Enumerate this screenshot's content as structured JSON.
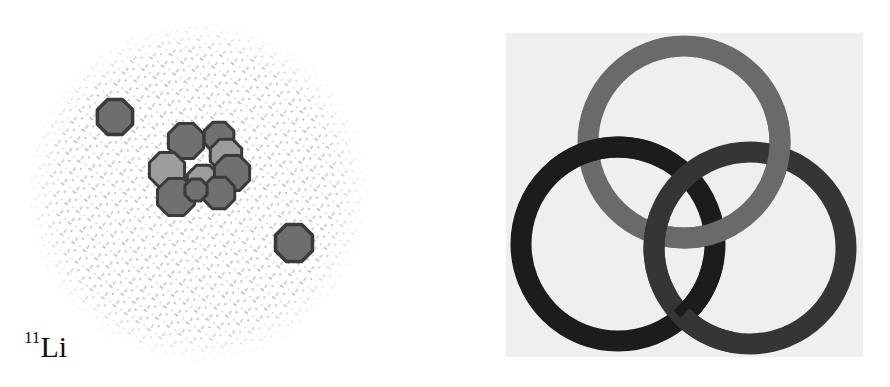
{
  "left_panel": {
    "title": "Lithium-11 halo nucleus",
    "label": {
      "superscript": "11",
      "element": "Li"
    },
    "halo_cloud": {
      "cx": 197,
      "cy": 192,
      "r": 172,
      "color": "#b8b8b8"
    },
    "core": {
      "outline_color": "#3a3a3a",
      "neutron_color": "#707070",
      "proton_color": "#9c9c9c",
      "nucleons": [
        {
          "type": "neutron",
          "cx": 186,
          "cy": 141,
          "r": 19
        },
        {
          "type": "neutron",
          "cx": 219,
          "cy": 137,
          "r": 16
        },
        {
          "type": "proton",
          "cx": 226,
          "cy": 155,
          "r": 17
        },
        {
          "type": "proton",
          "cx": 167,
          "cy": 170,
          "r": 19
        },
        {
          "type": "proton",
          "cx": 203,
          "cy": 181,
          "r": 17
        },
        {
          "type": "neutron",
          "cx": 232,
          "cy": 173,
          "r": 19
        },
        {
          "type": "neutron",
          "cx": 176,
          "cy": 197,
          "r": 20
        },
        {
          "type": "neutron",
          "cx": 219,
          "cy": 193,
          "r": 17
        },
        {
          "type": "neutron",
          "cx": 196,
          "cy": 190,
          "r": 12
        }
      ]
    },
    "halo_neutrons": [
      {
        "cx": 115,
        "cy": 117,
        "r": 19,
        "color": "#6e6e6e"
      },
      {
        "cx": 294,
        "cy": 243,
        "r": 20,
        "color": "#6e6e6e"
      }
    ]
  },
  "right_panel": {
    "title": "Borromean rings",
    "background": "#efefef",
    "ring_width": 21,
    "rings": [
      {
        "name": "top",
        "cx": 178,
        "cy": 109,
        "r": 96,
        "color": "#6a6a6a"
      },
      {
        "name": "left",
        "cx": 112,
        "cy": 211,
        "r": 97,
        "color": "#1c1c1c"
      },
      {
        "name": "right",
        "cx": 244,
        "cy": 215,
        "r": 96,
        "color": "#353535"
      }
    ]
  }
}
